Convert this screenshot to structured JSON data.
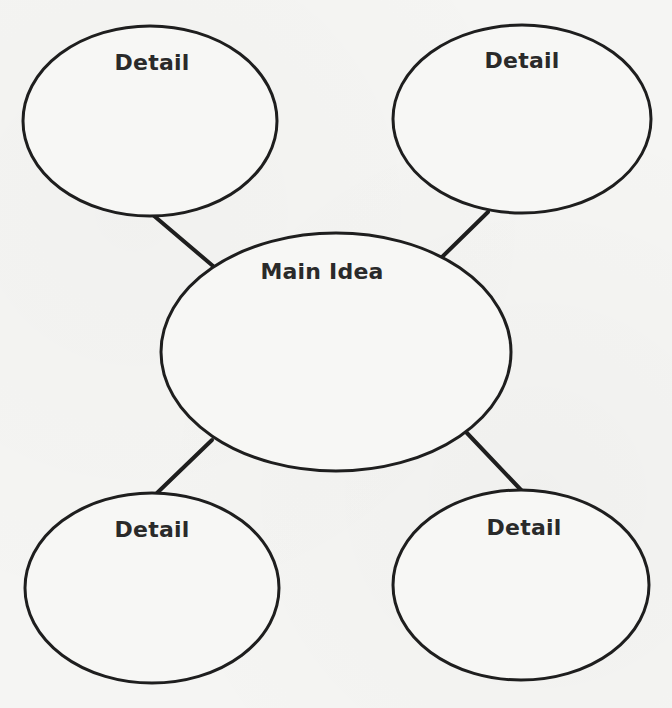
{
  "diagram": {
    "type": "main-idea-web",
    "main_node": {
      "label": "Main Idea"
    },
    "detail_nodes": [
      {
        "position": "top-left",
        "label": "Detail"
      },
      {
        "position": "top-right",
        "label": "Detail"
      },
      {
        "position": "bottom-left",
        "label": "Detail"
      },
      {
        "position": "bottom-right",
        "label": "Detail"
      }
    ],
    "colors": {
      "stroke": "#1e1e1e",
      "text": "#2a2a2a",
      "paper": "#f5f5f3"
    }
  }
}
